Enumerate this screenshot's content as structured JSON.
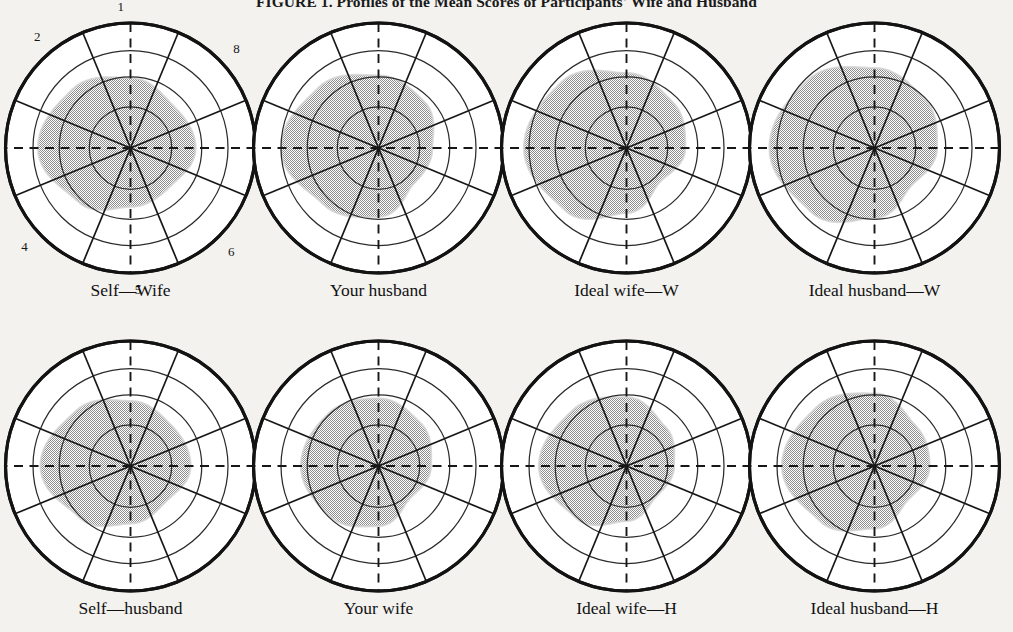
{
  "figure": {
    "title": "FIGURE 1. Profiles of the Mean Scores of Participants' Wife and Husband",
    "background_color": "#f3f2ef",
    "ink_color": "#131313",
    "shade_color": "#a8a8a8"
  },
  "sector_numbers": [
    "1",
    "2",
    "3",
    "4",
    "5",
    "6",
    "7",
    "8"
  ],
  "chart_data": {
    "type": "radar",
    "title": "FIGURE 1. Profiles of the Mean Scores of Participants' Wife and Husband",
    "categories": [
      "1",
      "2",
      "3",
      "4",
      "5",
      "6",
      "7",
      "8"
    ],
    "rings": [
      0.33,
      0.57,
      0.78,
      1.0
    ],
    "ring_count": 4,
    "grid": true,
    "legend": "none",
    "axis_note": "Eight octants numbered 1-8 clockwise starting at top; dashed vertical and horizontal reference axes.",
    "series": [
      {
        "name": "Self—Wife",
        "panel": 0,
        "values": [
          0.56,
          0.48,
          0.52,
          0.44,
          0.47,
          0.6,
          0.74,
          0.66
        ]
      },
      {
        "name": "Your husband",
        "panel": 1,
        "values": [
          0.58,
          0.52,
          0.43,
          0.4,
          0.55,
          0.63,
          0.78,
          0.68
        ]
      },
      {
        "name": "Ideal wife—W",
        "panel": 2,
        "values": [
          0.6,
          0.52,
          0.47,
          0.38,
          0.52,
          0.7,
          0.82,
          0.74
        ]
      },
      {
        "name": "Ideal husband—W",
        "panel": 3,
        "values": [
          0.64,
          0.56,
          0.5,
          0.42,
          0.56,
          0.72,
          0.84,
          0.76
        ]
      },
      {
        "name": "Self—husband",
        "panel": 4,
        "values": [
          0.52,
          0.46,
          0.48,
          0.4,
          0.46,
          0.58,
          0.72,
          0.62
        ]
      },
      {
        "name": "Your wife",
        "panel": 5,
        "values": [
          0.54,
          0.48,
          0.42,
          0.36,
          0.48,
          0.56,
          0.62,
          0.58
        ]
      },
      {
        "name": "Ideal wife—H",
        "panel": 6,
        "values": [
          0.55,
          0.44,
          0.38,
          0.34,
          0.44,
          0.58,
          0.7,
          0.62
        ]
      },
      {
        "name": "Ideal husband—H",
        "panel": 7,
        "values": [
          0.58,
          0.46,
          0.44,
          0.38,
          0.5,
          0.62,
          0.74,
          0.66
        ]
      }
    ]
  },
  "panels": [
    {
      "label": "Self—Wife",
      "show_numbers": true
    },
    {
      "label": "Your husband",
      "show_numbers": false
    },
    {
      "label": "Ideal wife—W",
      "show_numbers": false
    },
    {
      "label": "Ideal husband—W",
      "show_numbers": false
    },
    {
      "label": "Self—husband",
      "show_numbers": false
    },
    {
      "label": "Your wife",
      "show_numbers": false
    },
    {
      "label": "Ideal wife—H",
      "show_numbers": false
    },
    {
      "label": "Ideal husband—H",
      "show_numbers": false
    }
  ]
}
